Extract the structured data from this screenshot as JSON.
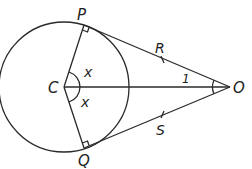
{
  "diagram": {
    "type": "geometry",
    "points": {
      "C": {
        "label": "C",
        "x": 64,
        "y": 87
      },
      "P": {
        "label": "P",
        "x": 84,
        "y": 25
      },
      "Q": {
        "label": "Q",
        "x": 84,
        "y": 148
      },
      "O": {
        "label": "O",
        "x": 230,
        "y": 87
      },
      "R": {
        "label": "R",
        "x": 163,
        "y": 60
      },
      "S": {
        "label": "S",
        "x": 163,
        "y": 114
      }
    },
    "circle": {
      "center": "C",
      "radius": 65
    },
    "angle_labels": {
      "PCO": "x",
      "QCO": "x",
      "POC": "1"
    },
    "right_angles": [
      "CPO",
      "CQO"
    ],
    "tick_marks": [
      "R on PO",
      "S on QO"
    ],
    "stroke_color": "#2a2a2a"
  }
}
